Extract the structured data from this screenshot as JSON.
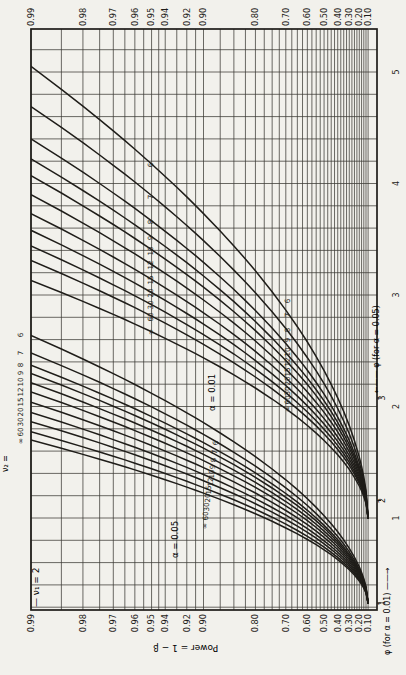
{
  "page": {
    "background": "#f2f1ec",
    "ink": "#1f1d19",
    "left_edge_text": "(continued)"
  },
  "chart_data": {
    "type": "line",
    "power_axis": {
      "label": "Power = 1 − β",
      "major_ticks": [
        "0.99",
        "0.98",
        "0.97",
        "0.96",
        "0.95",
        "0.94",
        "0.92",
        "0.90",
        "0.80",
        "0.70",
        "0.60",
        "0.50",
        "0.40",
        "0.30",
        "0.20",
        "0.10"
      ],
      "major_values": [
        0.99,
        0.98,
        0.97,
        0.96,
        0.95,
        0.94,
        0.92,
        0.9,
        0.8,
        0.7,
        0.6,
        0.5,
        0.4,
        0.3,
        0.2,
        0.1
      ],
      "minor_values": [
        0.985,
        0.975,
        0.965,
        0.955,
        0.945,
        0.93,
        0.91,
        0.875,
        0.85,
        0.825,
        0.775,
        0.75,
        0.725,
        0.675,
        0.65,
        0.625,
        0.575,
        0.55,
        0.525,
        0.475,
        0.45,
        0.425,
        0.375,
        0.35,
        0.325,
        0.275,
        0.25,
        0.225,
        0.175,
        0.15,
        0.125
      ],
      "scale": "position linear in log10(1 - power), 0.99 at left border, 0.10 near right border"
    },
    "phi_axis_001": {
      "label": "φ (for α = 0.01) ——→",
      "ticks": [
        "1",
        "2",
        "3",
        "4",
        "5"
      ]
    },
    "phi_axis_005": {
      "label": "←—— φ (for α = 0.05)",
      "ticks": [
        "1",
        "2",
        "3"
      ]
    },
    "nu1_label": "— ν₁ = 2",
    "nu2_prefix": "ν₂ =",
    "families": [
      {
        "name": "alpha-0.01",
        "label": "α = 0.01",
        "nu2": [
          "6",
          "7",
          "8",
          "9",
          "10",
          "12",
          "15",
          "20",
          "30",
          "60",
          "∞"
        ],
        "phi_scale": "phi01",
        "phi_at_power_099": [
          5.05,
          4.69,
          4.4,
          4.22,
          4.07,
          3.9,
          3.73,
          3.58,
          3.44,
          3.31,
          3.13
        ],
        "phi_at_power_010": 1.0,
        "label_clusters": [
          {
            "x": 150,
            "dx": 0,
            "y": [
              165,
              197,
              222,
              238,
              251,
              265,
              280,
              293,
              305,
              317,
              332
            ]
          },
          {
            "x": 287,
            "dx": 0,
            "y": [
              301,
              315,
              330,
              340,
              352,
              362,
              372,
              381,
              391,
              400,
              409
            ]
          }
        ]
      },
      {
        "name": "alpha-0.05",
        "label": "α = 0.05",
        "nu2": [
          "6",
          "7",
          "8",
          "9",
          "10",
          "12",
          "15",
          "20",
          "30",
          "60",
          "∞"
        ],
        "phi_scale": "phi05",
        "phi_at_power_099": [
          3.61,
          3.44,
          3.32,
          3.24,
          3.15,
          3.06,
          2.96,
          2.86,
          2.77,
          2.67,
          2.59
        ],
        "phi_at_power_010": 1.0,
        "label_clusters": [
          {
            "x": 20,
            "dx": 0,
            "y": [
              335,
              353,
              365,
              373,
              382,
              392,
              402,
              412,
              422,
              432,
              441
            ]
          },
          {
            "x": 215,
            "dx": -1.1,
            "y": [
              443,
              452,
              460,
              467,
              474,
              482,
              490,
              498,
              507,
              516,
              526
            ]
          }
        ]
      }
    ],
    "curve_model": {
      "exponent": 0.55,
      "p_min": 0.1,
      "p_max": 0.99
    }
  }
}
